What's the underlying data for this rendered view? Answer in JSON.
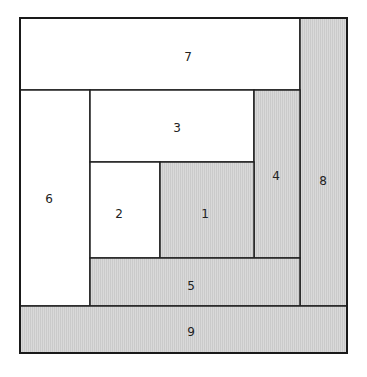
{
  "diagram": {
    "colors": {
      "white_fill": "#ffffff",
      "gray_fill": "#d7d7d7",
      "gray_stripe": "#c9c9c9",
      "line": "#222222"
    },
    "pieces": [
      {
        "label": "1",
        "fill": "gray",
        "x": 160,
        "y": 162,
        "w": 94,
        "h": 96
      },
      {
        "label": "2",
        "fill": "white",
        "x": 90,
        "y": 162,
        "w": 70,
        "h": 96
      },
      {
        "label": "3",
        "fill": "white",
        "x": 90,
        "y": 90,
        "w": 164,
        "h": 72
      },
      {
        "label": "4",
        "fill": "gray",
        "x": 254,
        "y": 90,
        "w": 46,
        "h": 168
      },
      {
        "label": "5",
        "fill": "gray",
        "x": 90,
        "y": 258,
        "w": 210,
        "h": 48
      },
      {
        "label": "6",
        "fill": "white",
        "x": 20,
        "y": 90,
        "w": 70,
        "h": 216
      },
      {
        "label": "7",
        "fill": "white",
        "x": 20,
        "y": 18,
        "w": 280,
        "h": 72
      },
      {
        "label": "8",
        "fill": "gray",
        "x": 300,
        "y": 18,
        "w": 47,
        "h": 288
      },
      {
        "label": "9",
        "fill": "gray",
        "x": 20,
        "y": 306,
        "w": 327,
        "h": 47
      }
    ],
    "labels": {
      "p1": "1",
      "p2": "2",
      "p3": "3",
      "p4": "4",
      "p5": "5",
      "p6": "6",
      "p7": "7",
      "p8": "8",
      "p9": "9"
    }
  }
}
